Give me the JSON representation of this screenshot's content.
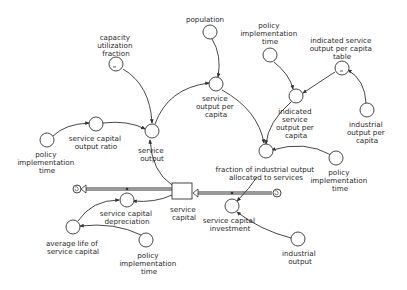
{
  "diagram": {
    "type": "stock-and-flow",
    "stocks": [
      {
        "id": "service_capital",
        "label": [
          "service",
          "capital"
        ]
      }
    ],
    "flows": [
      {
        "id": "service_capital_investment",
        "label": [
          "service capital",
          "investment"
        ],
        "direction": "into service capital"
      },
      {
        "id": "service_capital_depreciation",
        "label": [
          "service capital",
          "depreciation"
        ],
        "direction": "out of service capital"
      }
    ],
    "auxiliaries": [
      {
        "id": "capacity_utilization_fraction",
        "label": [
          "capacity",
          "utilization",
          "fraction"
        ],
        "table": true
      },
      {
        "id": "population",
        "label": [
          "population"
        ]
      },
      {
        "id": "policy_impl_time_top",
        "label": [
          "policy",
          "implementation",
          "time"
        ]
      },
      {
        "id": "indicated_sopc_table",
        "label": [
          "indicated service",
          "output per capita",
          "table"
        ],
        "table": true
      },
      {
        "id": "service_output_per_capita",
        "label": [
          "service",
          "output per",
          "capita"
        ]
      },
      {
        "id": "indicated_sopc",
        "label": [
          "indicated",
          "service",
          "output per",
          "capita"
        ]
      },
      {
        "id": "industrial_output_per_capita",
        "label": [
          "industrial",
          "output per",
          "capita"
        ]
      },
      {
        "id": "service_capital_output_ratio",
        "label": [
          "service capital",
          "output ratio"
        ]
      },
      {
        "id": "policy_impl_time_left",
        "label": [
          "policy",
          "implementation",
          "time"
        ]
      },
      {
        "id": "service_output",
        "label": [
          "service",
          "output"
        ]
      },
      {
        "id": "fioas",
        "label": [
          "fraction of industrial output",
          "allocated to services"
        ]
      },
      {
        "id": "policy_impl_time_right",
        "label": [
          "policy",
          "implementation",
          "time"
        ]
      },
      {
        "id": "average_life_service_capital",
        "label": [
          "average life of",
          "service capital"
        ]
      },
      {
        "id": "policy_impl_time_bottom",
        "label": [
          "policy",
          "implementation",
          "time"
        ]
      },
      {
        "id": "industrial_output",
        "label": [
          "industrial",
          "output"
        ]
      }
    ],
    "links": [
      [
        "capacity_utilization_fraction",
        "service_output"
      ],
      [
        "service_capital_output_ratio",
        "service_output"
      ],
      [
        "policy_impl_time_left",
        "service_capital_output_ratio"
      ],
      [
        "service_capital",
        "service_output"
      ],
      [
        "service_output",
        "service_output_per_capita"
      ],
      [
        "population",
        "service_output_per_capita"
      ],
      [
        "service_output_per_capita",
        "fioas"
      ],
      [
        "policy_impl_time_top",
        "indicated_sopc"
      ],
      [
        "indicated_sopc_table",
        "indicated_sopc"
      ],
      [
        "industrial_output_per_capita",
        "indicated_sopc_table"
      ],
      [
        "indicated_sopc",
        "fioas"
      ],
      [
        "policy_impl_time_right",
        "fioas"
      ],
      [
        "fioas",
        "service_capital_investment"
      ],
      [
        "industrial_output",
        "service_capital_investment"
      ],
      [
        "service_capital",
        "service_capital_depreciation"
      ],
      [
        "average_life_service_capital",
        "service_capital_depreciation"
      ],
      [
        "policy_impl_time_bottom",
        "average_life_service_capital"
      ]
    ]
  },
  "labels": {
    "capacity_utilization_fraction": [
      "capacity",
      "utilization",
      "fraction"
    ],
    "population": [
      "population"
    ],
    "policy_impl_time_top": [
      "policy",
      "implementation",
      "time"
    ],
    "indicated_sopc_table": [
      "indicated service",
      "output per capita",
      "table"
    ],
    "service_output_per_capita": [
      "service",
      "output per",
      "capita"
    ],
    "indicated_sopc": [
      "indicated",
      "service",
      "output per",
      "capita"
    ],
    "industrial_output_per_capita": [
      "industrial",
      "output per",
      "capita"
    ],
    "service_capital_output_ratio": [
      "service capital",
      "output ratio"
    ],
    "policy_impl_time_left": [
      "policy",
      "implementation",
      "time"
    ],
    "service_output": [
      "service",
      "output"
    ],
    "fioas": [
      "fraction of industrial output",
      "allocated to services"
    ],
    "policy_impl_time_right": [
      "policy",
      "implementation",
      "time"
    ],
    "service_capital": [
      "service",
      "capital"
    ],
    "service_capital_depreciation": [
      "service capital",
      "depreciation"
    ],
    "service_capital_investment": [
      "service capital",
      "investment"
    ],
    "average_life_service_capital": [
      "average life of",
      "service capital"
    ],
    "policy_impl_time_bottom": [
      "policy",
      "implementation",
      "time"
    ],
    "industrial_output": [
      "industrial",
      "output"
    ]
  },
  "colors": {
    "line": "#333333",
    "text": "#2a2a2a",
    "background": "#ffffff"
  }
}
